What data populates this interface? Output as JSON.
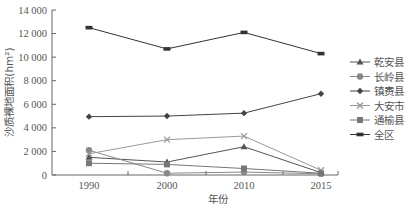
{
  "chart_data": {
    "type": "line",
    "title": "",
    "xlabel": "年份",
    "ylabel": "沙质裸地面积(hm²)",
    "x": [
      "1990",
      "2000",
      "2010",
      "2015"
    ],
    "ylim": [
      0,
      14000
    ],
    "yticks": [
      0,
      2000,
      4000,
      6000,
      8000,
      10000,
      12000,
      14000
    ],
    "ytick_labels": [
      "0",
      "2 000",
      "4 000",
      "6 000",
      "8 000",
      "10 000",
      "12 000",
      "14 000"
    ],
    "grid": false,
    "legend_position": "right",
    "series": [
      {
        "name": "乾安县",
        "marker": "triangle",
        "color": "#555555",
        "values": [
          1500,
          1100,
          2400,
          200
        ]
      },
      {
        "name": "长岭县",
        "marker": "circle",
        "color": "#888888",
        "values": [
          2100,
          150,
          250,
          100
        ]
      },
      {
        "name": "镇赉县",
        "marker": "diamond",
        "color": "#444444",
        "values": [
          4950,
          5000,
          5250,
          6900
        ]
      },
      {
        "name": "大安市",
        "marker": "x",
        "color": "#999999",
        "values": [
          1800,
          3000,
          3300,
          400
        ]
      },
      {
        "name": "通榆县",
        "marker": "square",
        "color": "#777777",
        "values": [
          1000,
          900,
          550,
          150
        ]
      },
      {
        "name": "全区",
        "marker": "dash",
        "color": "#333333",
        "values": [
          12500,
          10700,
          12100,
          10300
        ]
      }
    ]
  }
}
